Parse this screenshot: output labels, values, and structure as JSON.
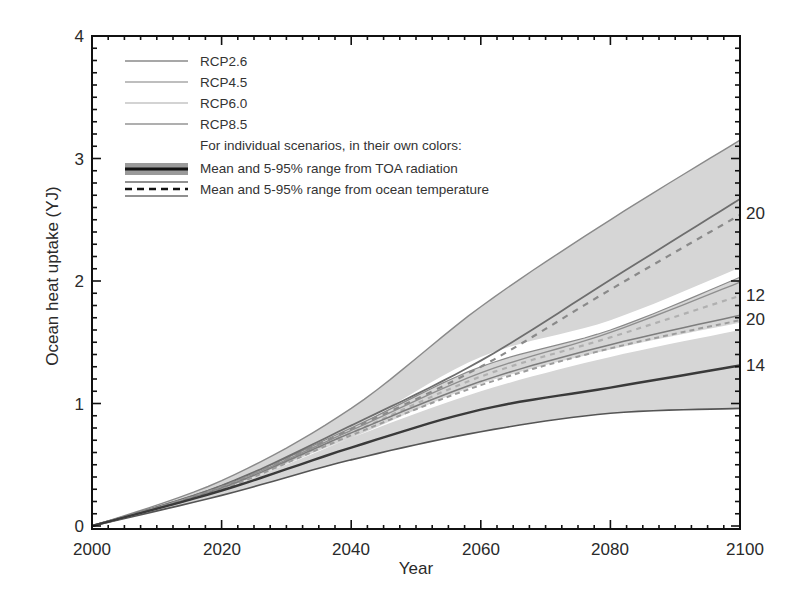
{
  "chart_data": {
    "type": "area",
    "title": "",
    "xlabel": "Year",
    "ylabel": "Ocean heat uptake (YJ)",
    "xlim": [
      2000,
      2100
    ],
    "ylim": [
      0,
      4
    ],
    "x_ticks": [
      2000,
      2020,
      2040,
      2060,
      2080,
      2100
    ],
    "y_ticks": [
      0,
      1,
      2,
      3,
      4
    ],
    "grid": false,
    "legend_position": "upper left",
    "x": [
      2000,
      2020,
      2040,
      2060,
      2080,
      2100
    ],
    "series": [
      {
        "name": "RCP8.5 5-95% range (TOA radiation) upper",
        "values": [
          0.0,
          0.37,
          0.96,
          1.79,
          2.5,
          3.15
        ]
      },
      {
        "name": "RCP8.5 mean (TOA radiation)",
        "values": [
          0.0,
          0.33,
          0.82,
          1.35,
          2.01,
          2.67
        ]
      },
      {
        "name": "RCP8.5 mean (ocean temperature)",
        "values": [
          0.0,
          0.32,
          0.79,
          1.3,
          1.93,
          2.54
        ]
      },
      {
        "name": "RCP6.0 5-95% range upper",
        "values": [
          0.0,
          0.33,
          0.8,
          1.3,
          1.6,
          2.03
        ]
      },
      {
        "name": "RCP6.0 mean (TOA radiation)",
        "values": [
          0.0,
          0.32,
          0.78,
          1.25,
          1.58,
          1.99
        ]
      },
      {
        "name": "RCP6.0 mean (ocean temperature)",
        "values": [
          0.0,
          0.31,
          0.76,
          1.22,
          1.54,
          1.88
        ]
      },
      {
        "name": "RCP4.5 mean (TOA radiation)",
        "values": [
          0.0,
          0.31,
          0.76,
          1.18,
          1.48,
          1.72
        ]
      },
      {
        "name": "RCP4.5 mean (ocean temperature)",
        "values": [
          0.0,
          0.3,
          0.74,
          1.15,
          1.45,
          1.68
        ]
      },
      {
        "name": "RCP2.6 5-95% range upper",
        "values": [
          0.0,
          0.3,
          0.72,
          1.1,
          1.38,
          1.6
        ]
      },
      {
        "name": "RCP2.6 mean",
        "values": [
          0.0,
          0.29,
          0.64,
          0.95,
          1.13,
          1.31
        ]
      },
      {
        "name": "5-95% range lower",
        "values": [
          0.0,
          0.25,
          0.54,
          0.77,
          0.92,
          0.96
        ]
      }
    ],
    "model_count_labels": [
      {
        "text": "20",
        "value": 2.57
      },
      {
        "text": "12",
        "value": 1.9
      },
      {
        "text": "20",
        "value": 1.71
      },
      {
        "text": "14",
        "value": 1.32
      }
    ],
    "legend": [
      {
        "label": "RCP2.6",
        "style": "thin-line"
      },
      {
        "label": "RCP4.5",
        "style": "thin-line"
      },
      {
        "label": "RCP6.0",
        "style": "thin-line"
      },
      {
        "label": "RCP8.5",
        "style": "thin-line"
      },
      {
        "label": "For individual scenarios, in their own colors:",
        "style": "none"
      },
      {
        "label": "Mean and 5-95% range from TOA radiation",
        "style": "thick-band"
      },
      {
        "label": "Mean and 5-95% range from ocean temperature",
        "style": "dashed-with-bounds"
      }
    ],
    "colors": {
      "band": "#d6d6d6",
      "band_edge": "#8a8a8a",
      "mean_line": "#6e6e6e",
      "dark_mean": "#3a3a3a",
      "axis": "#111111",
      "white_gap": "#ffffff"
    }
  },
  "axes": {
    "xlabel": "Year",
    "ylabel": "Ocean heat uptake (YJ)",
    "x_tick_labels": [
      "2000",
      "2020",
      "2040",
      "2060",
      "2080",
      "2100"
    ],
    "y_tick_labels": [
      "0",
      "1",
      "2",
      "3",
      "4"
    ]
  },
  "legend": {
    "items": [
      "RCP2.6",
      "RCP4.5",
      "RCP6.0",
      "RCP8.5"
    ],
    "note": "For individual scenarios, in their own colors:",
    "toa": "Mean and 5-95% range from TOA radiation",
    "ocean": "Mean and 5-95% range from ocean temperature"
  },
  "counts": [
    "20",
    "12",
    "20",
    "14"
  ]
}
